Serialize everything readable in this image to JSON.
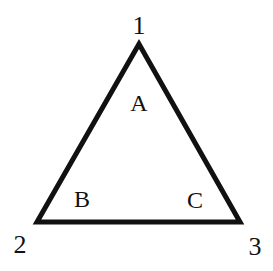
{
  "diagram": {
    "type": "triangle",
    "stroke_color": "#111111",
    "background": "#ffffff",
    "vertices": [
      {
        "label": "1",
        "x": 139,
        "y": 44,
        "label_x": 139,
        "label_y": 34
      },
      {
        "label": "2",
        "x": 37,
        "y": 222,
        "label_x": 20,
        "label_y": 253
      },
      {
        "label": "3",
        "x": 240,
        "y": 222,
        "label_x": 255,
        "label_y": 255
      }
    ],
    "angles": [
      {
        "label": "A",
        "x": 139,
        "y": 111
      },
      {
        "label": "B",
        "x": 82,
        "y": 207
      },
      {
        "label": "C",
        "x": 195,
        "y": 208
      }
    ]
  }
}
